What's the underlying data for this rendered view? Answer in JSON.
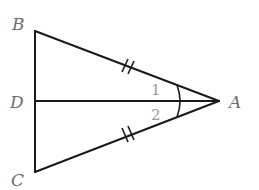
{
  "figure": {
    "type": "geometry-diagram",
    "points": {
      "A": {
        "label": "A",
        "x": 219,
        "y": 101
      },
      "B": {
        "label": "B",
        "x": 35,
        "y": 31
      },
      "C": {
        "label": "C",
        "x": 35,
        "y": 172
      },
      "D": {
        "label": "D",
        "x": 35,
        "y": 101
      }
    },
    "segments": [
      "AB",
      "AC",
      "AD",
      "BC"
    ],
    "equal_marks": {
      "AB": "double-tick",
      "AC": "double-tick"
    },
    "angles": {
      "angle1": "1",
      "angle2": "2"
    },
    "colors": {
      "lines": "#1a1a1a",
      "labels": "#6d6d6d",
      "angle_numbers": "#9a9a9a"
    }
  }
}
